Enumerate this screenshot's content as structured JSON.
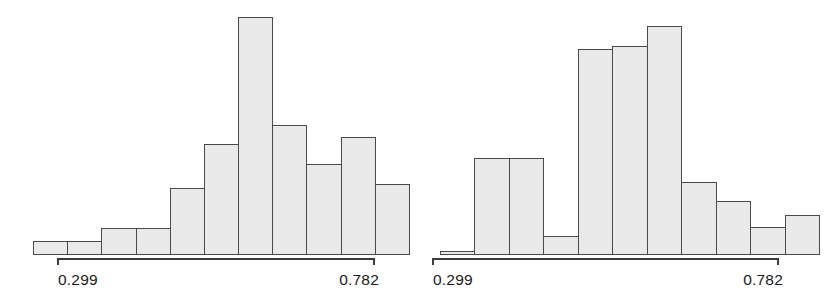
{
  "figure": {
    "background_color": "#ffffff",
    "bar_fill_color": "#e9e9e9",
    "bar_edge_color": "#4a4a4a",
    "axis_color": "#3b3b3b",
    "label_color": "#1a1a1a"
  },
  "chart_data": [
    {
      "type": "bar",
      "name": "left-histogram",
      "title": "",
      "subtitle": "",
      "xlabel": "",
      "ylabel": "",
      "grid": false,
      "legend": "none",
      "axis_ticks_shown": [
        "0.299",
        "0.782"
      ],
      "tick_low_label": "0.299",
      "tick_high_label": "0.782",
      "xlim": [
        0.299,
        0.782
      ],
      "ylim": [
        0,
        238
      ],
      "bin_count": 11,
      "bin_edges": [
        0.255,
        0.299,
        0.343,
        0.387,
        0.431,
        0.475,
        0.518,
        0.562,
        0.606,
        0.65,
        0.694,
        0.738
      ],
      "categories": [
        "b1",
        "b2",
        "b3",
        "b4",
        "b5",
        "b6",
        "b7",
        "b8",
        "b9",
        "b10",
        "b11"
      ],
      "values": [
        14,
        14,
        27,
        27,
        67,
        111,
        238,
        130,
        91,
        118,
        71
      ]
    },
    {
      "type": "bar",
      "name": "right-histogram",
      "title": "",
      "subtitle": "",
      "xlabel": "",
      "ylabel": "",
      "grid": false,
      "legend": "none",
      "axis_ticks_shown": [
        "0.299",
        "0.782"
      ],
      "tick_low_label": "0.299",
      "tick_high_label": "0.782",
      "xlim": [
        0.299,
        0.782
      ],
      "ylim": [
        0,
        229
      ],
      "bin_count": 11,
      "bin_edges": [
        0.255,
        0.299,
        0.343,
        0.387,
        0.431,
        0.475,
        0.518,
        0.562,
        0.606,
        0.65,
        0.694,
        0.738
      ],
      "categories": [
        "b1",
        "b2",
        "b3",
        "b4",
        "b5",
        "b6",
        "b7",
        "b8",
        "b9",
        "b10",
        "b11"
      ],
      "values": [
        4,
        97,
        97,
        19,
        206,
        209,
        229,
        73,
        54,
        28,
        40
      ]
    }
  ],
  "panels": [
    {
      "id": "left",
      "tick_low_label": "0.299",
      "tick_high_label": "0.782"
    },
    {
      "id": "right",
      "tick_low_label": "0.299",
      "tick_high_label": "0.782"
    }
  ]
}
